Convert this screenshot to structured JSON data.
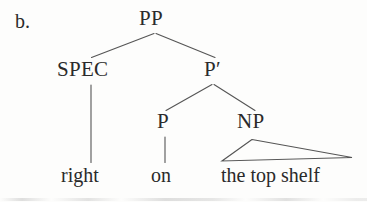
{
  "figure": {
    "item_letter": "b.",
    "kind": "syntactic-tree",
    "colors": {
      "background": "#fdfdfc",
      "ink": "#2a2a2a",
      "line": "#555555"
    }
  },
  "tree": {
    "nodes": {
      "root": "PP",
      "spec": "SPEC",
      "pbar": "P′",
      "p": "P",
      "np": "NP"
    },
    "terminals": {
      "spec_word": "right",
      "p_word": "on",
      "np_phrase": "the top shelf"
    },
    "structure": "PP → SPEC P′ ; P′ → P NP ; SPEC → right ; P → on ; NP △ the top shelf"
  },
  "geometry": {
    "pp_apex": [
      155,
      33
    ],
    "spec_top": [
      91,
      57
    ],
    "pbar_top": [
      214,
      57
    ],
    "pbar_apex": [
      213,
      84
    ],
    "p_top": [
      165,
      111
    ],
    "np_top": [
      254,
      111
    ],
    "spec_stem": [
      91,
      85,
      91,
      163
    ],
    "p_stem": [
      165,
      137,
      165,
      163
    ],
    "np_triangle": [
      252,
      139,
      222,
      161,
      352,
      157
    ]
  }
}
